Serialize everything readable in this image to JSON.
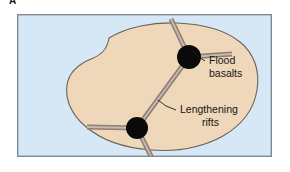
{
  "figure": {
    "panel_letter": "A",
    "type": "geologic-schematic-diagram"
  },
  "colors": {
    "ocean": "#d6e8f5",
    "landmass": "#eed8b9",
    "coastline": "#6b6259",
    "rift_band": "#8e7d74",
    "rift_center": "#c8b9ae",
    "hotspot": "#0a0a0a",
    "frame_border": "#7f8a93",
    "leader_line": "#1a1a1a",
    "label_text": "#151515",
    "page_background": "#ffffff"
  },
  "labels": [
    {
      "id": "flood-basalts",
      "line1": "Flood",
      "line2": "basalts",
      "x": 192,
      "y1": 50,
      "y2": 63,
      "leader": {
        "x1": 188,
        "y1": 47,
        "x2": 176,
        "y2": 36
      }
    },
    {
      "id": "lengthening-rifts",
      "line1": "Lengthening",
      "line2": "rifts",
      "x": 163,
      "y1": 99,
      "y2": 112,
      "leader": {
        "x1": 159,
        "y1": 96,
        "x2": 141,
        "y2": 86
      }
    }
  ],
  "hotspots": [
    {
      "id": "northern-triple-junction",
      "cx": 172,
      "cy": 43,
      "r": 12
    },
    {
      "id": "southern-triple-junction",
      "cx": 120,
      "cy": 114,
      "r": 11
    }
  ],
  "rift_arms": [
    {
      "id": "north-junction-arm-northwest",
      "from": [
        172,
        43
      ],
      "to": [
        154,
        5
      ]
    },
    {
      "id": "north-junction-arm-east",
      "from": [
        172,
        43
      ],
      "to": [
        215,
        40
      ]
    },
    {
      "id": "north-junction-arm-southwest",
      "from": [
        172,
        43
      ],
      "to": [
        120,
        114
      ]
    },
    {
      "id": "south-junction-arm-west",
      "from": [
        120,
        114
      ],
      "to": [
        70,
        113
      ]
    },
    {
      "id": "south-junction-arm-south",
      "from": [
        120,
        114
      ],
      "to": [
        143,
        160
      ]
    }
  ],
  "frame": {
    "x": 0,
    "y": 0,
    "width": 255,
    "height": 143,
    "border_width": 1.4
  }
}
